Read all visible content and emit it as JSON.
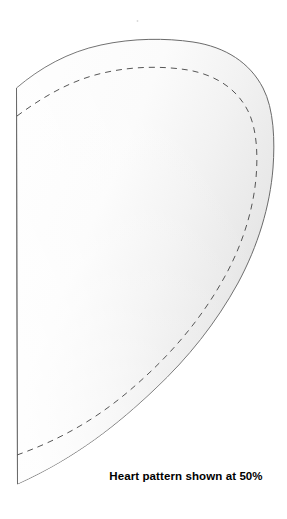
{
  "document": {
    "type": "sewing-pattern-sheet",
    "background_color": "#ffffff",
    "width": 287,
    "height": 519
  },
  "pattern_piece": {
    "name": "half-heart-pattern",
    "title": "Heart pattern",
    "outline_color": "#6a6a6a",
    "outline_width": 1,
    "fill_light": "#fdfdfd",
    "fill_mid": "#f2f2f2",
    "fill_dark": "#e2e2e2",
    "fold_edge_label": "left-fold-edge",
    "seam_line": {
      "name": "stitching-seam-line",
      "style": "dashed",
      "color": "#555555",
      "dash_length": 6,
      "dash_gap": 5,
      "stroke_width": 1,
      "inset": 15
    },
    "geometry": {
      "fold_edge_x": 16,
      "fold_edge_top_y": 88,
      "bottom_tip_x": 17,
      "bottom_tip_y": 484,
      "apex_x": 190,
      "apex_y": 41,
      "widest_x": 274,
      "widest_y": 175
    }
  },
  "caption": {
    "text": "Heart pattern shown at 50%",
    "scale_value": "50%",
    "color": "#000000"
  }
}
